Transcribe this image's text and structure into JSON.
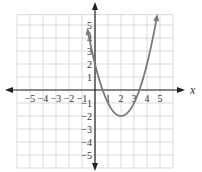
{
  "chart_data": {
    "type": "line",
    "title": "",
    "xlabel": "x",
    "ylabel": "",
    "function": "y = (x - 2)^2 - 2",
    "vertex": [
      2,
      -2
    ],
    "y_intercept": [
      0,
      2
    ],
    "x_intercepts": [
      0.59,
      3.41
    ],
    "x": [
      -0.6,
      -0.5,
      0,
      0.5,
      1,
      1.5,
      2,
      2.5,
      3,
      3.5,
      4,
      4.5,
      4.7
    ],
    "values": [
      4.76,
      4.25,
      2,
      0.25,
      -1,
      -1.75,
      -2,
      -1.75,
      -1,
      0.25,
      2,
      4.25,
      5.29
    ],
    "xlim": [
      -6,
      6
    ],
    "ylim": [
      -6,
      6
    ],
    "x_tick_labels": [
      "-5",
      "-4",
      "-3",
      "-2",
      "-1",
      "1",
      "2",
      "3",
      "4",
      "5"
    ],
    "y_tick_labels": [
      "5",
      "4",
      "3",
      "2",
      "1",
      "-1",
      "-2",
      "-3",
      "-4",
      "-5"
    ],
    "grid": true,
    "legend": "none",
    "curve_color": "#7a7a7a",
    "axis_color": "#222222",
    "grid_color": "#cccccc"
  }
}
